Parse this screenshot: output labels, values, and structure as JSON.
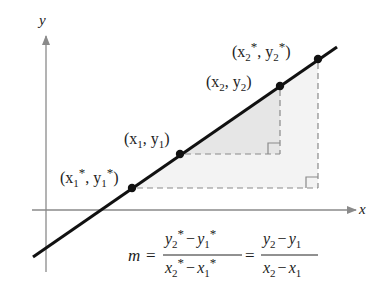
{
  "diagram": {
    "axes": {
      "x_label": "x",
      "y_label": "y",
      "axis_color": "#8a8a8a"
    },
    "line_color": "#111111",
    "shade_color": "#ededed",
    "dash_color": "#8a8a8a",
    "points": [
      {
        "id": "p1star",
        "label_main": "(x",
        "sub1": "1",
        "star1": "*",
        "mid": ", y",
        "sub2": "1",
        "star2": "*",
        "close": ")"
      },
      {
        "id": "p1",
        "label_main": "(x",
        "sub1": "1",
        "mid": ", y",
        "sub2": "1",
        "close": ")"
      },
      {
        "id": "p2",
        "label_main": "(x",
        "sub1": "2",
        "mid": ", y",
        "sub2": "2",
        "close": ")"
      },
      {
        "id": "p2star",
        "label_main": "(x",
        "sub1": "2",
        "star1": "*",
        "mid": ", y",
        "sub2": "2",
        "star2": "*",
        "close": ")"
      }
    ],
    "formula": {
      "lhs": "m",
      "equals": "=",
      "frac1": {
        "num": {
          "a": "y",
          "a_sub": "2",
          "a_star": "*",
          "minus": "−",
          "b": "y",
          "b_sub": "1",
          "b_star": "*"
        },
        "den": {
          "a": "x",
          "a_sub": "2",
          "a_star": "*",
          "minus": "−",
          "b": "x",
          "b_sub": "1",
          "b_star": "*"
        }
      },
      "frac2": {
        "num": {
          "a": "y",
          "a_sub": "2",
          "minus": "−",
          "b": "y",
          "b_sub": "1"
        },
        "den": {
          "a": "x",
          "a_sub": "2",
          "minus": "−",
          "b": "x",
          "b_sub": "1"
        }
      }
    }
  }
}
